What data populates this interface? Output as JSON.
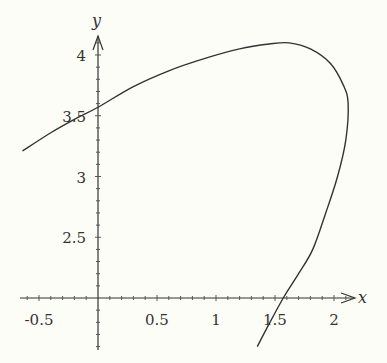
{
  "chart_data": {
    "type": "line",
    "title": "",
    "xlabel": "x",
    "ylabel": "y",
    "xlim": [
      -0.65,
      2.2
    ],
    "ylim": [
      1.6,
      4.2
    ],
    "x_axis_at_y": 2,
    "grid": false,
    "x_ticks": [
      -0.5,
      0.5,
      1,
      1.5,
      2
    ],
    "x_tick_labels": [
      "-0.5",
      "0.5",
      "1",
      "1.5",
      "2"
    ],
    "y_ticks": [
      2.5,
      3,
      3.5,
      4
    ],
    "y_tick_labels": [
      "2.5",
      "3",
      "3.5",
      "4"
    ],
    "series": [
      {
        "name": "parametric curve",
        "color": "#333333",
        "points": [
          [
            -0.64,
            3.21
          ],
          [
            -0.4,
            3.36
          ],
          [
            -0.2,
            3.47
          ],
          [
            0.0,
            3.57
          ],
          [
            0.3,
            3.74
          ],
          [
            0.6,
            3.87
          ],
          [
            0.9,
            3.97
          ],
          [
            1.2,
            4.05
          ],
          [
            1.45,
            4.09
          ],
          [
            1.62,
            4.1
          ],
          [
            1.8,
            4.05
          ],
          [
            1.97,
            3.93
          ],
          [
            2.08,
            3.75
          ],
          [
            2.12,
            3.6
          ],
          [
            2.1,
            3.3
          ],
          [
            2.03,
            3.0
          ],
          [
            1.93,
            2.7
          ],
          [
            1.82,
            2.4
          ],
          [
            1.7,
            2.2
          ],
          [
            1.57,
            2.0
          ],
          [
            1.43,
            1.75
          ],
          [
            1.35,
            1.6
          ]
        ]
      }
    ]
  },
  "labels": {
    "x_axis": "x",
    "y_axis": "y"
  }
}
